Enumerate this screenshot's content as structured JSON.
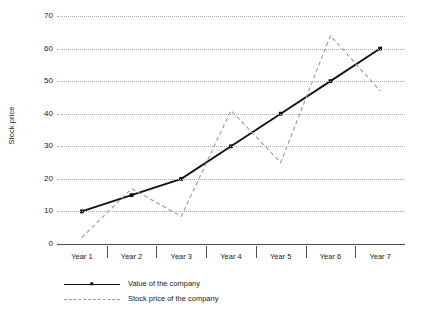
{
  "chart_data": {
    "type": "line",
    "title": "",
    "xlabel": "",
    "ylabel": "Stock price",
    "categories": [
      "Year 1",
      "Year 2",
      "Year 3",
      "Year 4",
      "Year 5",
      "Year 6",
      "Year 7"
    ],
    "ylim": [
      0,
      70
    ],
    "yticks": [
      0,
      10,
      20,
      30,
      40,
      50,
      60,
      70
    ],
    "ytick_labels": [
      "0",
      "10",
      "20",
      "30",
      "40",
      "50",
      "60",
      "70"
    ],
    "grid": true,
    "grid_axis": "y",
    "grid_style": "dotted",
    "legend_position": "bottom-left",
    "series": [
      {
        "name": "Value of the company",
        "values": [
          10,
          15,
          20,
          30,
          40,
          50,
          60
        ],
        "style": "solid",
        "color": "#121212",
        "marker": "square"
      },
      {
        "name": "Stock price of the company",
        "values": [
          2,
          17,
          8.5,
          41,
          25,
          64,
          47
        ],
        "style": "dashed",
        "color": "#9a9a9a",
        "marker": "none"
      }
    ]
  },
  "axis": {
    "y_title": "Stock price",
    "y_labels": [
      "70",
      "60",
      "50",
      "40",
      "30",
      "20",
      "10",
      "0"
    ],
    "x_labels": [
      "Year 1",
      "Year 2",
      "Year 3",
      "Year 4",
      "Year 5",
      "Year 6",
      "Year 7"
    ]
  },
  "legend": {
    "items": [
      {
        "label": "Value of the company"
      },
      {
        "label": "Stock price of the company"
      }
    ]
  }
}
